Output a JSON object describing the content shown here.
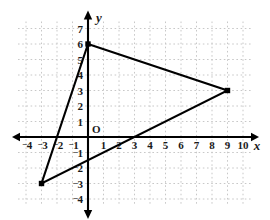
{
  "figure": {
    "type": "coordinate-plane-triangle",
    "width": 270,
    "height": 220,
    "background_color": "#ffffff",
    "grid_color": "#c8c8c8",
    "axis_color": "#000000",
    "shape_color": "#000000",
    "label_color": "#1a1a1a"
  },
  "axes": {
    "x_label": "x",
    "y_label": "y",
    "origin_label": "O",
    "x_min": -4,
    "x_max": 10,
    "y_min": -4,
    "y_max": 7,
    "unit_px": 15.5,
    "origin_px": {
      "x": 88,
      "y": 137
    },
    "grid": "on",
    "grid_style": "dotted",
    "x_ticks": [
      {
        "value": -4,
        "label": "4",
        "negative": true
      },
      {
        "value": -3,
        "label": "3",
        "negative": true
      },
      {
        "value": -2,
        "label": "2",
        "negative": true
      },
      {
        "value": -1,
        "label": "1",
        "negative": true
      },
      {
        "value": 1,
        "label": "1",
        "negative": false
      },
      {
        "value": 2,
        "label": "2",
        "negative": false
      },
      {
        "value": 3,
        "label": "3",
        "negative": false
      },
      {
        "value": 4,
        "label": "4",
        "negative": false
      },
      {
        "value": 5,
        "label": "5",
        "negative": false
      },
      {
        "value": 6,
        "label": "6",
        "negative": false
      },
      {
        "value": 7,
        "label": "7",
        "negative": false
      },
      {
        "value": 8,
        "label": "8",
        "negative": false
      },
      {
        "value": 9,
        "label": "9",
        "negative": false
      },
      {
        "value": 10,
        "label": "10",
        "negative": false
      }
    ],
    "y_ticks": [
      {
        "value": 7,
        "label": "7",
        "negative": false
      },
      {
        "value": 6,
        "label": "6",
        "negative": false
      },
      {
        "value": 5,
        "label": "5",
        "negative": false
      },
      {
        "value": 4,
        "label": "4",
        "negative": false
      },
      {
        "value": 3,
        "label": "3",
        "negative": false
      },
      {
        "value": 2,
        "label": "2",
        "negative": false
      },
      {
        "value": 1,
        "label": "1",
        "negative": false
      },
      {
        "value": -1,
        "label": "1",
        "negative": true
      },
      {
        "value": -2,
        "label": "2",
        "negative": true
      },
      {
        "value": -3,
        "label": "3",
        "negative": true
      },
      {
        "value": -4,
        "label": "4",
        "negative": true
      }
    ]
  },
  "chart_data": {
    "type": "scatter",
    "title": "",
    "xlabel": "x",
    "ylabel": "y",
    "xlim": [
      -4,
      10
    ],
    "ylim": [
      -4,
      7
    ],
    "grid": true,
    "legend": "none",
    "shapes": [
      {
        "name": "triangle",
        "closed": true,
        "stroke": "#000000",
        "fill": "none",
        "vertices": [
          {
            "x": 0,
            "y": 6,
            "marker": "filled-square"
          },
          {
            "x": 9,
            "y": 3,
            "marker": "filled-square"
          },
          {
            "x": -3,
            "y": -3,
            "marker": "filled-square"
          }
        ]
      }
    ]
  }
}
